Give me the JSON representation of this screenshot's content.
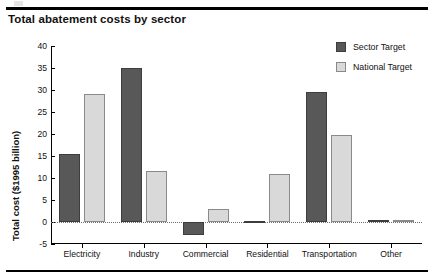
{
  "figure": {
    "title": "Total abatement costs by sector"
  },
  "legend": {
    "position": "top-right",
    "items": [
      {
        "label": "Sector Target",
        "key": "sector",
        "color": "#585858"
      },
      {
        "label": "National Target",
        "key": "national",
        "color": "#d9d9d9"
      }
    ]
  },
  "chart_data": {
    "type": "bar",
    "title": "Total abatement costs by sector",
    "xlabel": "",
    "ylabel": "Total cost ($1995 billion)",
    "ylim": [
      -5,
      40
    ],
    "yticks": [
      -5,
      0,
      5,
      10,
      15,
      20,
      25,
      30,
      35,
      40
    ],
    "ytick_labels": [
      "-5",
      "0",
      "5",
      "10",
      "15",
      "20",
      "25",
      "30",
      "35",
      "40"
    ],
    "grid": false,
    "zero_line": true,
    "categories": [
      "Electricity",
      "Industry",
      "Commercial",
      "Residential",
      "Transportation",
      "Other"
    ],
    "series": [
      {
        "name": "Sector Target",
        "color": "#585858",
        "values": [
          15.5,
          35.0,
          -3.0,
          0.3,
          29.5,
          0.5
        ]
      },
      {
        "name": "National Target",
        "color": "#d9d9d9",
        "values": [
          29.0,
          11.5,
          3.0,
          11.0,
          19.7,
          0.5
        ]
      }
    ]
  }
}
